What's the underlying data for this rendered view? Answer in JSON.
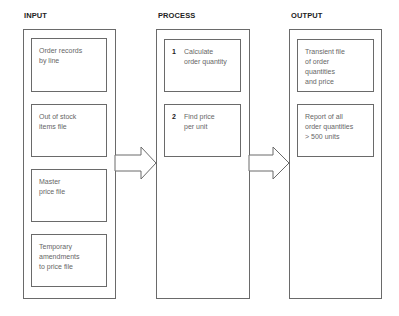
{
  "columns": {
    "input": {
      "title": "INPUT",
      "items": [
        {
          "text": "Order records\nby line"
        },
        {
          "text": "Out of stock\nitems file"
        },
        {
          "text": "Master\nprice file"
        },
        {
          "text": "Temporary\namendments\nto price file"
        }
      ]
    },
    "process": {
      "title": "PROCESS",
      "items": [
        {
          "num": "1",
          "text": "Calculate\norder quantity"
        },
        {
          "num": "2",
          "text": "Find price\nper unit"
        }
      ]
    },
    "output": {
      "title": "OUTPUT",
      "items": [
        {
          "text": "Transient file\nof order\nquantities\nand price"
        },
        {
          "text": "Report of all\norder quantities\n> 500 units"
        }
      ]
    }
  },
  "arrows": [
    {
      "from": "input",
      "to": "process",
      "icon": "right-block-arrow-icon"
    },
    {
      "from": "process",
      "to": "output",
      "icon": "right-block-arrow-icon"
    }
  ],
  "colors": {
    "line": "#6a6a6a",
    "title": "#222222",
    "text": "#666666",
    "background": "#ffffff"
  }
}
